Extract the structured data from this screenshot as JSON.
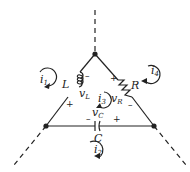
{
  "diagram": {
    "type": "circuit",
    "nodes": [
      {
        "id": "top",
        "x": 95,
        "y": 54
      },
      {
        "id": "left",
        "x": 46,
        "y": 126
      },
      {
        "id": "right",
        "x": 154,
        "y": 126
      }
    ],
    "components": {
      "inductor": {
        "label": "L",
        "voltage_label": "v",
        "voltage_sub": "L",
        "plus": "+",
        "minus": "–"
      },
      "resistor": {
        "label": "R",
        "voltage_label": "v",
        "voltage_sub": "R",
        "plus": "+",
        "minus": "–"
      },
      "capacitor": {
        "label": "C",
        "voltage_label": "v",
        "voltage_sub": "C",
        "plus": "+",
        "minus": "–"
      }
    },
    "mesh_currents": [
      {
        "id": "i1",
        "letter": "i",
        "sub": "1"
      },
      {
        "id": "i2",
        "letter": "i",
        "sub": "2"
      },
      {
        "id": "i3",
        "letter": "i",
        "sub": "3"
      },
      {
        "id": "i4",
        "letter": "i",
        "sub": "4"
      }
    ],
    "colors": {
      "line": "#222222",
      "background": "#ffffff"
    }
  }
}
